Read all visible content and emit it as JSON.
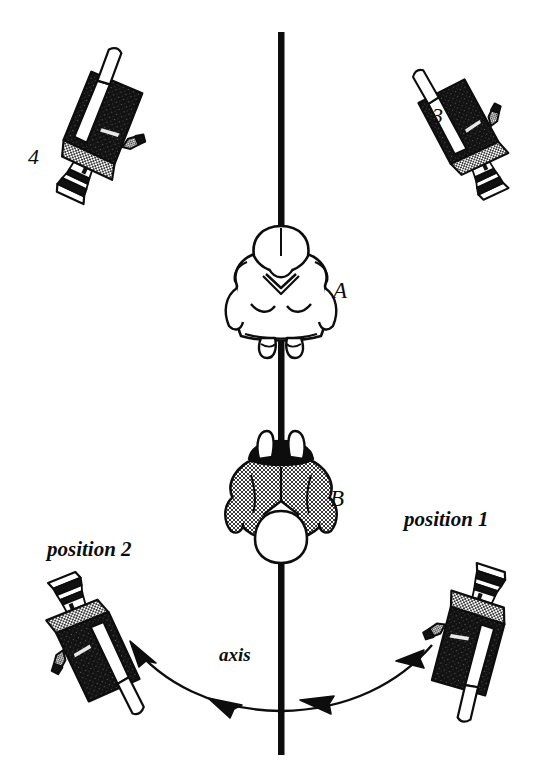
{
  "figure": {
    "axis_label": "axis",
    "colors": {
      "ink": "#0d0d0d",
      "background": "#ffffff",
      "stipple_gray": "#9a9a9a",
      "camera_body": "#111111"
    }
  },
  "subjects": [
    {
      "id": "A",
      "label": "A",
      "description": "person viewed from above, light clothing, standing on the axis, facing subject B"
    },
    {
      "id": "B",
      "label": "B",
      "description": "person viewed from above, dark hair and gray stippled clothing, standing on the axis, facing subject A"
    }
  ],
  "cameras": [
    {
      "id": "cam3",
      "label": "3",
      "label_kind": "number",
      "side": "right",
      "row": "top"
    },
    {
      "id": "cam4",
      "label": "4",
      "label_kind": "number",
      "side": "left",
      "row": "top"
    },
    {
      "id": "cam-position-1",
      "label": "position 1",
      "label_kind": "position",
      "side": "right",
      "row": "bottom"
    },
    {
      "id": "cam-position-2",
      "label": "position 2",
      "label_kind": "position",
      "side": "left",
      "row": "bottom"
    }
  ],
  "axis": {
    "label": "axis",
    "orientation": "vertical",
    "description": "solid vertical line of action running through subjects A and B"
  },
  "motion_arc": {
    "description": "curved double-headed path sweeping from position 1 on the right, below the subjects, across the axis to position 2 on the left",
    "direction": "right-to-left",
    "arrowheads": 4
  }
}
